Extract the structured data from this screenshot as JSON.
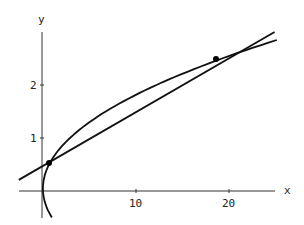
{
  "chart_data": {
    "type": "line",
    "title": "",
    "xlabel": "x",
    "ylabel": "y",
    "x_ticks": [
      10,
      20
    ],
    "y_ticks": [
      1,
      2
    ],
    "xlim": [
      -2.5,
      25
    ],
    "ylim": [
      -0.5,
      3
    ],
    "grid": false,
    "series": [
      {
        "name": "curve",
        "description": "sideways parabola x ≈ 3.2y² − 0.3y",
        "points": [
          [
            0.2,
            -0.5
          ],
          [
            -0.1,
            -0.25
          ],
          [
            0,
            0
          ],
          [
            0.22,
            0.2
          ],
          [
            0.74,
            0.53
          ],
          [
            1.5,
            0.75
          ],
          [
            3.2,
            1.0
          ],
          [
            6.9,
            1.5
          ],
          [
            12.2,
            2.0
          ],
          [
            18.6,
            2.49
          ],
          [
            24.3,
            2.85
          ]
        ]
      },
      {
        "name": "line",
        "description": "straight line y ≈ 0.109x + 0.46",
        "points": [
          [
            -2.6,
            0.21
          ],
          [
            0.65,
            0.53
          ],
          [
            18.6,
            2.49
          ],
          [
            24.9,
            3.0
          ]
        ]
      }
    ],
    "intersections": [
      [
        0.65,
        0.53
      ],
      [
        18.6,
        2.49
      ]
    ]
  }
}
